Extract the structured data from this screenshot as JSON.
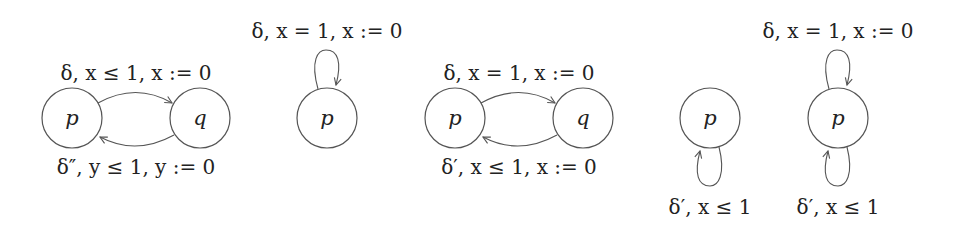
{
  "diagrams": [
    {
      "id": "a1",
      "states": [
        {
          "name": "p"
        },
        {
          "name": "q"
        }
      ],
      "edges": [
        {
          "from": "p",
          "to": "q",
          "label": "δ, x ≤ 1, x := 0"
        },
        {
          "from": "q",
          "to": "p",
          "label": "δ″, y ≤ 1, y := 0"
        }
      ]
    },
    {
      "id": "a2",
      "states": [
        {
          "name": "p"
        }
      ],
      "edges": [
        {
          "from": "p",
          "to": "p",
          "position": "top",
          "label": "δ, x = 1, x := 0"
        }
      ]
    },
    {
      "id": "a3",
      "states": [
        {
          "name": "p"
        },
        {
          "name": "q"
        }
      ],
      "edges": [
        {
          "from": "p",
          "to": "q",
          "label": "δ, x = 1, x := 0"
        },
        {
          "from": "q",
          "to": "p",
          "label": "δ′, x ≤ 1, x := 0"
        }
      ]
    },
    {
      "id": "a4",
      "states": [
        {
          "name": "p"
        }
      ],
      "edges": [
        {
          "from": "p",
          "to": "p",
          "position": "bottom",
          "label": "δ′, x ≤ 1"
        }
      ]
    },
    {
      "id": "a5",
      "states": [
        {
          "name": "p"
        }
      ],
      "edges": [
        {
          "from": "p",
          "to": "p",
          "position": "top",
          "label": "δ, x = 1, x := 0"
        },
        {
          "from": "p",
          "to": "p",
          "position": "bottom",
          "label": "δ′, x ≤ 1"
        }
      ]
    }
  ]
}
